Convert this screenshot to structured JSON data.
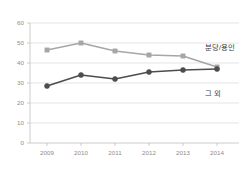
{
  "chart_data": {
    "type": "line",
    "title": "",
    "xlabel": "",
    "ylabel": "",
    "categories": [
      "2009",
      "2010",
      "2011",
      "2012",
      "2013",
      "2014"
    ],
    "ylim": [
      0,
      60
    ],
    "yticks": [
      0,
      10,
      20,
      30,
      40,
      50,
      60
    ],
    "grid": true,
    "legend_position": "inline-right",
    "series": [
      {
        "name": "분당/용인",
        "color": "#a6a6a6",
        "marker": "square",
        "values": [
          46.5,
          50.0,
          46.0,
          44.0,
          43.5,
          38.0
        ]
      },
      {
        "name": "그 외",
        "color": "#4d4d4d",
        "marker": "circle",
        "values": [
          28.5,
          34.0,
          32.0,
          35.5,
          36.5,
          37.0
        ]
      }
    ],
    "annotations": [
      {
        "text": "분당/용인",
        "series": "분당/용인"
      },
      {
        "text": "그 외",
        "series": "그 외"
      }
    ]
  },
  "axis": {
    "y_tick_labels": [
      "60",
      "50",
      "40",
      "30",
      "20",
      "10",
      "0"
    ],
    "x_tick_labels": [
      "2009",
      "2010",
      "2011",
      "2012",
      "2013",
      "2014"
    ]
  },
  "colors": {
    "series_upper": "#a6a6a6",
    "series_lower": "#4d4d4d",
    "gridline": "#d9d9d9",
    "axis": "#bfbfbf",
    "tick_text": "#8c8c8c",
    "label_text": "#3a3a3a",
    "background": "#ffffff"
  }
}
